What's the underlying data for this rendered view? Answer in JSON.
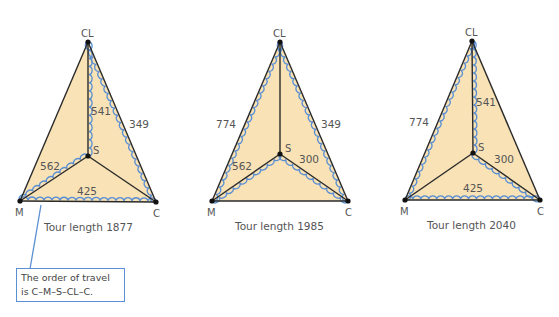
{
  "colors": {
    "fill": "#f8e2b6",
    "edge": "#2a2a2a",
    "tour_path": "#5b8fd3",
    "text": "#555555"
  },
  "diagrams": [
    {
      "vertices": {
        "CL": "CL",
        "S": "S",
        "M": "M",
        "C": "C"
      },
      "edge_labels": {
        "CL_S": "541",
        "CL_C": "349",
        "M_S": "562",
        "M_C": "425"
      },
      "tour_edges": [
        "CL-S",
        "CL-C",
        "M-S",
        "M-C"
      ],
      "caption": "Tour length 1877"
    },
    {
      "vertices": {
        "CL": "CL",
        "S": "S",
        "M": "M",
        "C": "C"
      },
      "edge_labels": {
        "CL_M": "774",
        "CL_C": "349",
        "M_S": "562",
        "S_C": "300"
      },
      "tour_edges": [
        "CL-M",
        "CL-C",
        "M-S",
        "S-C"
      ],
      "caption": "Tour length 1985"
    },
    {
      "vertices": {
        "CL": "CL",
        "S": "S",
        "M": "M",
        "C": "C"
      },
      "edge_labels": {
        "CL_M": "774",
        "CL_S": "541",
        "S_C": "300",
        "M_C": "425"
      },
      "tour_edges": [
        "CL-M",
        "CL-S",
        "S-C",
        "M-C"
      ],
      "caption": "Tour length 2040"
    }
  ],
  "callout": {
    "line1": "The order of travel",
    "line2": "is C–M–S–CL–C."
  }
}
